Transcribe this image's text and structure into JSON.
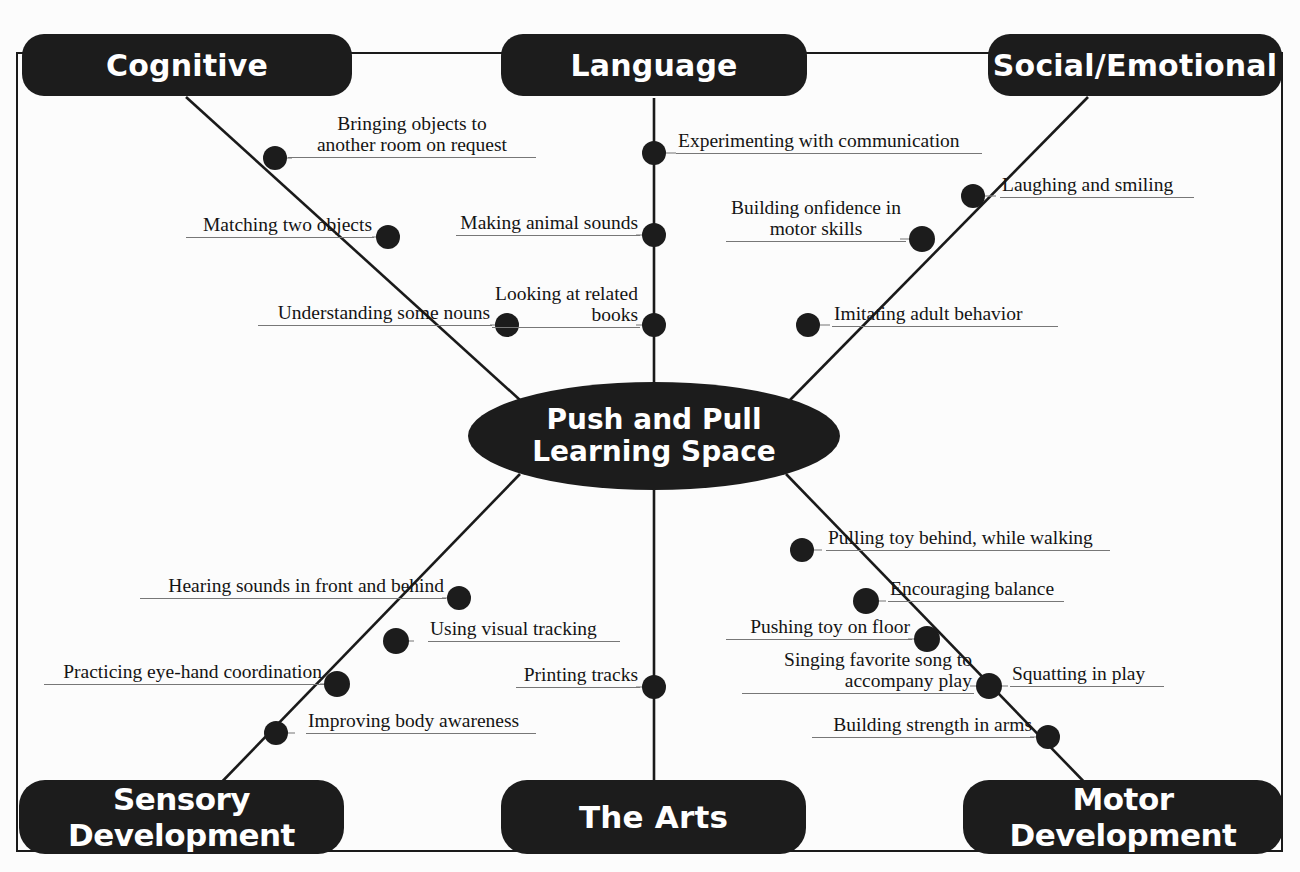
{
  "diagram": {
    "type": "mind-map",
    "center": {
      "line1": "Push and Pull",
      "line2": "Learning Space"
    },
    "categories": [
      {
        "id": "cognitive",
        "label": "Cognitive",
        "position": "top-left"
      },
      {
        "id": "language",
        "label": "Language",
        "position": "top-center"
      },
      {
        "id": "social-emotional",
        "label": "Social/Emotional",
        "position": "top-right"
      },
      {
        "id": "sensory",
        "label": "Sensory Development",
        "position": "bottom-left"
      },
      {
        "id": "arts",
        "label": "The Arts",
        "position": "bottom-center"
      },
      {
        "id": "motor",
        "label": "Motor Development",
        "position": "bottom-right"
      }
    ],
    "branches": [
      {
        "category": "cognitive",
        "leaves": [
          {
            "text_line1": "Bringing objects to",
            "text_line2": "another room on request"
          },
          {
            "text_line1": "Matching two objects",
            "text_line2": ""
          },
          {
            "text_line1": "Understanding some nouns",
            "text_line2": ""
          }
        ]
      },
      {
        "category": "language",
        "leaves": [
          {
            "text_line1": "Experimenting with communication",
            "text_line2": ""
          },
          {
            "text_line1": "Making animal sounds",
            "text_line2": ""
          },
          {
            "text_line1": "Looking at related",
            "text_line2": "books"
          }
        ]
      },
      {
        "category": "social-emotional",
        "leaves": [
          {
            "text_line1": "Laughing and smiling",
            "text_line2": ""
          },
          {
            "text_line1": "Building onfidence in",
            "text_line2": "motor skills"
          },
          {
            "text_line1": "Imitating adult behavior",
            "text_line2": ""
          }
        ]
      },
      {
        "category": "sensory",
        "leaves": [
          {
            "text_line1": "Hearing sounds in front and behind",
            "text_line2": ""
          },
          {
            "text_line1": "Using visual tracking",
            "text_line2": ""
          },
          {
            "text_line1": "Practicing eye-hand coordination",
            "text_line2": ""
          },
          {
            "text_line1": "Improving body awareness",
            "text_line2": ""
          }
        ]
      },
      {
        "category": "arts",
        "leaves": [
          {
            "text_line1": "Printing tracks",
            "text_line2": ""
          }
        ]
      },
      {
        "category": "motor",
        "leaves": [
          {
            "text_line1": "Pulling toy behind, while walking",
            "text_line2": ""
          },
          {
            "text_line1": "Encouraging balance",
            "text_line2": ""
          },
          {
            "text_line1": "Pushing toy on floor",
            "text_line2": ""
          },
          {
            "text_line1": "Singing favorite song to",
            "text_line2": "accompany play"
          },
          {
            "text_line1": "Squatting in play",
            "text_line2": ""
          },
          {
            "text_line1": "Building strength in arms",
            "text_line2": ""
          }
        ]
      }
    ],
    "colors": {
      "node_fill": "#1c1c1c",
      "node_text": "#ffffff",
      "line": "#1a1a1a",
      "leaf_text": "#141414",
      "leaf_rule": "#777777",
      "background": "#fcfcfc"
    }
  },
  "labels": {
    "cognitive": "Cognitive",
    "language": "Language",
    "social_emotional": "Social/Emotional",
    "sensory": "Sensory Development",
    "arts": "The Arts",
    "motor": "Motor Development",
    "center_l1": "Push and Pull",
    "center_l2": "Learning Space",
    "cog_1a": "Bringing objects to",
    "cog_1b": "another room on request",
    "cog_2": "Matching two objects",
    "cog_3": "Understanding some nouns",
    "lang_1": "Experimenting with communication",
    "lang_2": "Making animal sounds",
    "lang_3a": "Looking at related",
    "lang_3b": "books",
    "soc_1": "Laughing and smiling",
    "soc_2a": "Building onfidence in",
    "soc_2b": "motor skills",
    "soc_3": "Imitating adult behavior",
    "sen_1": "Hearing sounds in front and behind",
    "sen_2": "Using visual tracking",
    "sen_3": "Practicing eye-hand coordination",
    "sen_4": "Improving body awareness",
    "arts_1": "Printing tracks",
    "mot_1": "Pulling toy behind, while walking",
    "mot_2": "Encouraging balance",
    "mot_3": "Pushing toy on floor",
    "mot_4a": "Singing favorite song to",
    "mot_4b": "accompany play",
    "mot_5": "Squatting in play",
    "mot_6": "Building strength in arms"
  }
}
